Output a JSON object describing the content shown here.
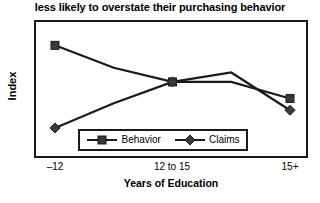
{
  "chart_data": {
    "type": "line",
    "title": "less likely to overstate their purchasing behavior",
    "xlabel": "Years of Education",
    "ylabel": "Index",
    "categories": [
      "–12",
      "",
      "12 to 15",
      "",
      "15+"
    ],
    "tick_labels": [
      "–12",
      "12 to 15",
      "15+"
    ],
    "x": [
      0,
      1,
      2,
      3,
      4
    ],
    "grid": false,
    "legend_position": "inside-bottom-center",
    "ylim": [
      0,
      100
    ],
    "yticks_visible": false,
    "series": [
      {
        "name": "Behavior",
        "marker": "square",
        "color": "#1a1a1a",
        "values": [
          87,
          68,
          56,
          56,
          42
        ]
      },
      {
        "name": "Claims",
        "marker": "diamond",
        "color": "#1a1a1a",
        "values": [
          17,
          38,
          56,
          64,
          32
        ]
      }
    ]
  },
  "legend": {
    "entries": [
      {
        "label": "Behavior",
        "marker": "square-marker"
      },
      {
        "label": "Claims",
        "marker": "diamond-marker"
      }
    ]
  },
  "axes": {
    "x_tick_0": "–12",
    "x_tick_1": "12 to 15",
    "x_tick_2": "15+"
  },
  "colors": {
    "line": "#1a1a1a",
    "frame": "#1a1a1a",
    "background": "#ffffff"
  }
}
